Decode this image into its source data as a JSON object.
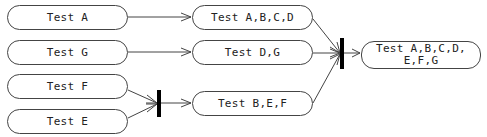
{
  "diagram": {
    "type": "activity-diagram",
    "nodes": [
      {
        "id": "test-a",
        "label": "Test A"
      },
      {
        "id": "test-g",
        "label": "Test G"
      },
      {
        "id": "test-f",
        "label": "Test F"
      },
      {
        "id": "test-e",
        "label": "Test E"
      },
      {
        "id": "test-abcd",
        "label": "Test A,B,C,D"
      },
      {
        "id": "test-dg",
        "label": "Test D,G"
      },
      {
        "id": "test-bef",
        "label": "Test B,E,F"
      },
      {
        "id": "test-all",
        "label": "Test A,B,C,D, E,F,G",
        "line1": "Test A,B,C,D,",
        "line2": "E,F,G"
      }
    ],
    "joins": [
      {
        "id": "join-fe",
        "inputs": [
          "test-f",
          "test-e"
        ],
        "output": "test-bef"
      },
      {
        "id": "join-all",
        "inputs": [
          "test-abcd",
          "test-dg",
          "test-bef"
        ],
        "output": "test-all"
      }
    ],
    "edges": [
      {
        "from": "test-a",
        "to": "test-abcd"
      },
      {
        "from": "test-g",
        "to": "test-dg"
      },
      {
        "from": "test-f",
        "to": "join-fe"
      },
      {
        "from": "test-e",
        "to": "join-fe"
      },
      {
        "from": "join-fe",
        "to": "test-bef"
      },
      {
        "from": "test-abcd",
        "to": "join-all"
      },
      {
        "from": "test-dg",
        "to": "join-all"
      },
      {
        "from": "test-bef",
        "to": "join-all"
      },
      {
        "from": "join-all",
        "to": "test-all"
      }
    ],
    "colors": {
      "line": "#444444",
      "bar": "#000000",
      "background": "#ffffff"
    }
  }
}
